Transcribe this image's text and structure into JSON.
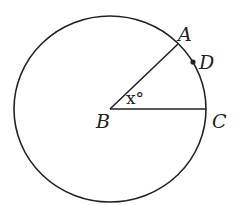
{
  "diagram": {
    "type": "circle-geometry",
    "circle": {
      "center_label": "B",
      "cx": 110,
      "cy": 109,
      "r": 94
    },
    "points": [
      {
        "id": "A",
        "label": "A",
        "x": 178,
        "y": 44,
        "on": "circle"
      },
      {
        "id": "D",
        "label": "D",
        "x": 193,
        "y": 62,
        "on": "circle",
        "marked": true
      },
      {
        "id": "B",
        "label": "B",
        "x": 110,
        "y": 109,
        "on": "center"
      },
      {
        "id": "C",
        "label": "C",
        "x": 204,
        "y": 109,
        "on": "circle"
      }
    ],
    "segments": [
      {
        "from": "B",
        "to": "A"
      },
      {
        "from": "B",
        "to": "C"
      }
    ],
    "angle": {
      "vertex": "B",
      "between": [
        "A",
        "C"
      ],
      "label": "x°"
    },
    "colors": {
      "stroke": "#222222",
      "background": "#ffffff"
    }
  },
  "labels": {
    "A": "A",
    "B": "B",
    "C": "C",
    "D": "D",
    "angle": "x°"
  }
}
